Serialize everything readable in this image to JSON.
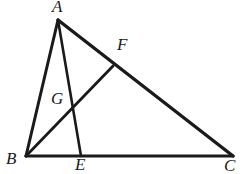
{
  "figure": {
    "type": "geometry-diagram",
    "background_color": "#ffffff",
    "stroke_color": "#1a1a1a",
    "label_color": "#1a1a1a",
    "canvas": {
      "width": 245,
      "height": 174
    },
    "points": {
      "A": {
        "label": "A",
        "x": 58,
        "y": 20
      },
      "B": {
        "label": "B",
        "x": 26,
        "y": 156
      },
      "C": {
        "label": "C",
        "x": 233,
        "y": 156
      },
      "E": {
        "label": "E",
        "x": 81,
        "y": 156
      },
      "F": {
        "label": "F",
        "x": 113,
        "y": 66
      },
      "G": {
        "label": "G",
        "x": 74,
        "y": 108
      }
    },
    "segments": [
      {
        "name": "AB",
        "from": "A",
        "to": "B",
        "width": 3.0
      },
      {
        "name": "AC",
        "from": "A",
        "to": "C",
        "width": 3.4
      },
      {
        "name": "BC",
        "from": "B",
        "to": "C",
        "width": 3.2
      },
      {
        "name": "AE",
        "from": "A",
        "to": "E",
        "width": 2.6
      },
      {
        "name": "BF",
        "from": "B",
        "to": "F",
        "width": 2.8
      }
    ],
    "labels": [
      {
        "id": "A",
        "text": "A"
      },
      {
        "id": "F",
        "text": "F"
      },
      {
        "id": "G",
        "text": "G"
      },
      {
        "id": "B",
        "text": "B"
      },
      {
        "id": "E",
        "text": "E"
      },
      {
        "id": "C",
        "text": "C"
      }
    ]
  }
}
